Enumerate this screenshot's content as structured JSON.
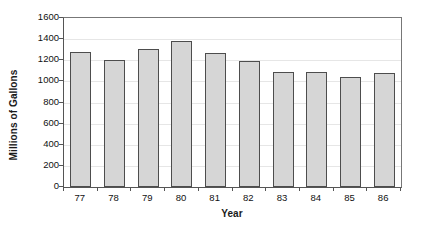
{
  "chart_data": {
    "type": "bar",
    "title": "",
    "subtitle": "",
    "xlabel": "Year",
    "ylabel": "Millions of Gallons",
    "categories": [
      "77",
      "78",
      "79",
      "80",
      "81",
      "82",
      "83",
      "84",
      "85",
      "86"
    ],
    "values": [
      1280,
      1200,
      1310,
      1380,
      1265,
      1195,
      1085,
      1090,
      1040,
      1075
    ],
    "ylim": [
      0,
      1600
    ],
    "y_ticks": [
      0,
      200,
      400,
      600,
      800,
      1000,
      1200,
      1400,
      1600
    ],
    "y_tick_labels": [
      "0",
      "200",
      "400",
      "600",
      "800",
      "1000",
      "1200",
      "1400",
      "1600"
    ],
    "grid": true,
    "grid_axis": "y",
    "legend": false,
    "legend_position": "none",
    "series": [
      {
        "name": "Millions of Gallons",
        "values": [
          1280,
          1200,
          1310,
          1380,
          1265,
          1195,
          1085,
          1090,
          1040,
          1075
        ]
      }
    ],
    "colors": {
      "bar_fill": "#d6d6d6",
      "bar_border": "#4d4d4d",
      "gridline": "#e6e6e6",
      "axis": "#555555",
      "plot_border": "#777777",
      "text": "#111111",
      "background": "#ffffff"
    }
  }
}
